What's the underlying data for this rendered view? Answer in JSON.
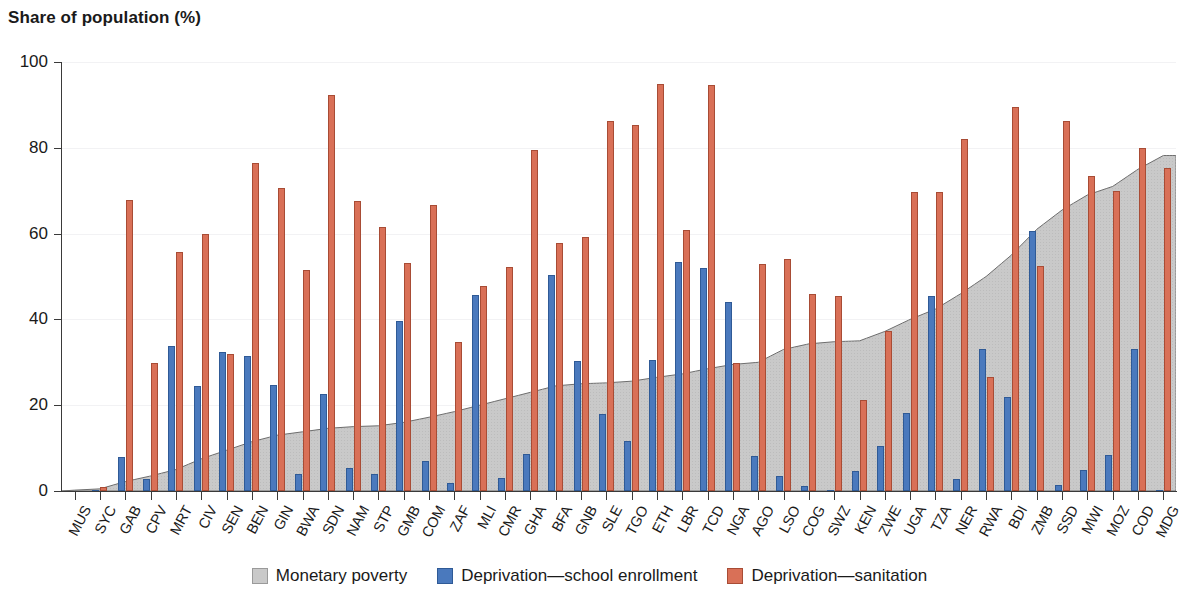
{
  "chart_data": {
    "type": "bar",
    "title": "",
    "ylabel": "Share of population (%)",
    "xlabel": "",
    "ylim": [
      0,
      100
    ],
    "yticks": [
      0,
      20,
      40,
      60,
      80,
      100
    ],
    "grid": true,
    "legend_position": "bottom",
    "categories": [
      "MUS",
      "SYC",
      "GAB",
      "CPV",
      "MRT",
      "CIV",
      "SEN",
      "BEN",
      "GIN",
      "BWA",
      "SDN",
      "NAM",
      "STP",
      "GMB",
      "COM",
      "ZAF",
      "MLI",
      "CMR",
      "GHA",
      "BFA",
      "GNB",
      "SLE",
      "TGO",
      "ETH",
      "LBR",
      "TCD",
      "NGA",
      "AGO",
      "LSO",
      "COG",
      "SWZ",
      "KEN",
      "ZWE",
      "UGA",
      "TZA",
      "NER",
      "RWA",
      "BDI",
      "ZMB",
      "SSD",
      "MWI",
      "MOZ",
      "COD",
      "MDG"
    ],
    "series": [
      {
        "name": "Monetary poverty",
        "type": "area",
        "color": "#c9c9c9",
        "values": [
          0.2,
          0.5,
          2.2,
          3.5,
          5.0,
          7.5,
          9.5,
          11.5,
          13.0,
          13.8,
          14.6,
          15.0,
          15.2,
          16.0,
          17.2,
          18.5,
          20.0,
          21.5,
          23.0,
          24.5,
          25.0,
          25.2,
          25.6,
          26.5,
          27.3,
          28.5,
          29.5,
          30.0,
          33.0,
          34.3,
          34.8,
          35.0,
          37.2,
          40.0,
          42.4,
          46.0,
          50.0,
          55.0,
          61.0,
          65.5,
          69.0,
          71.0,
          75.0,
          78.2
        ]
      },
      {
        "name": "Deprivation—school enrollment",
        "type": "bar",
        "color": "#4a79bd",
        "values": [
          null,
          0.3,
          7.9,
          2.7,
          33.7,
          24.4,
          32.5,
          31.5,
          24.6,
          4.0,
          22.6,
          5.3,
          3.9,
          39.6,
          6.9,
          1.8,
          45.6,
          3.1,
          8.6,
          50.3,
          30.4,
          18.0,
          11.7,
          30.5,
          53.4,
          51.9,
          44.0,
          8.1,
          3.6,
          1.2,
          0.2,
          4.6,
          10.4,
          18.2,
          45.5,
          2.9,
          33.0,
          21.9,
          60.7,
          1.5,
          4.8,
          8.5,
          33.0,
          0.2
        ]
      },
      {
        "name": "Deprivation—sanitation",
        "type": "bar",
        "color": "#d97057",
        "values": [
          null,
          1.0,
          67.9,
          29.8,
          55.7,
          59.8,
          32.0,
          76.5,
          70.7,
          51.6,
          92.4,
          67.6,
          61.6,
          53.2,
          66.7,
          34.7,
          47.7,
          52.1,
          79.4,
          57.9,
          59.3,
          86.2,
          85.4,
          94.9,
          60.8,
          94.6,
          29.8,
          52.8,
          54.0,
          46.0,
          45.4,
          21.3,
          37.3,
          69.8,
          69.8,
          82.0,
          26.6,
          89.4,
          52.4,
          86.3,
          73.5,
          70.0,
          80.0,
          75.2
        ]
      }
    ]
  },
  "legend": {
    "items": [
      {
        "label": "Monetary poverty",
        "swatch": "gray-square-icon"
      },
      {
        "label": "Deprivation—school enrollment",
        "swatch": "blue-square-icon"
      },
      {
        "label": "Deprivation—sanitation",
        "swatch": "red-square-icon"
      }
    ]
  },
  "colors": {
    "area": "#c9c9c9",
    "area_border": "#6d6d6d",
    "blue": "#4a79bd",
    "blue_border": "#2f5a96",
    "red": "#d97057",
    "red_border": "#a84c35",
    "axis": "#3a3a3a",
    "grid": "#f2f2f4",
    "text": "#1a1a1a"
  }
}
